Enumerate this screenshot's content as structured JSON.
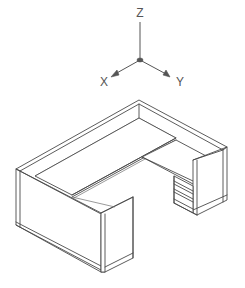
{
  "diagram": {
    "type": "isometric-cad-view",
    "colors": {
      "line": "#4a4a4a",
      "background": "#ffffff",
      "axis": "#555555"
    },
    "axes": {
      "labels": {
        "z": "Z",
        "x": "X",
        "y": "Y"
      },
      "icon": "ucs-axis-tripod-icon"
    },
    "components": [
      "back-panel",
      "left-end-panel",
      "right-end-panel",
      "work-surface",
      "return-surface",
      "front-modesty-panel",
      "return-end-panel",
      "pedestal-drawers"
    ]
  }
}
